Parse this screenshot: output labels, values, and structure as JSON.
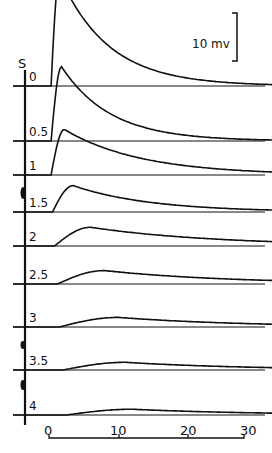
{
  "figure": {
    "stim_label": "S",
    "scale_bar_label": "10 mv",
    "x_ticks": [
      "0",
      "10",
      "20",
      "30"
    ]
  },
  "chart_data": {
    "type": "line",
    "title": "",
    "xlabel": "",
    "ylabel": "",
    "scale_bar": {
      "label": "10 mv",
      "orientation": "vertical"
    },
    "x_ticks": [
      0,
      10,
      20,
      30
    ],
    "xlim": [
      -4,
      33
    ],
    "grid": false,
    "legend": "trace labels at left of each baseline",
    "series": [
      {
        "name": "0",
        "onset": 0.3,
        "peak_mv": 23.0,
        "peak_time": 1.5,
        "decay": "fast"
      },
      {
        "name": "0.5",
        "onset": 0.3,
        "peak_mv": 15.5,
        "peak_time": 1.8,
        "decay": "fast"
      },
      {
        "name": "1",
        "onset": 0.3,
        "peak_mv": 9.5,
        "peak_time": 2.2,
        "decay": "medium"
      },
      {
        "name": "1.5",
        "onset": 0.5,
        "peak_mv": 5.5,
        "peak_time": 3.5,
        "decay": "medium"
      },
      {
        "name": "2",
        "onset": 0.8,
        "peak_mv": 3.9,
        "peak_time": 6,
        "decay": "slow"
      },
      {
        "name": "2.5",
        "onset": 1.2,
        "peak_mv": 2.8,
        "peak_time": 8,
        "decay": "slow"
      },
      {
        "name": "3",
        "onset": 1.5,
        "peak_mv": 2.0,
        "peak_time": 10,
        "decay": "slow"
      },
      {
        "name": "3.5",
        "onset": 2.0,
        "peak_mv": 1.6,
        "peak_time": 11,
        "decay": "slow"
      },
      {
        "name": "4",
        "onset": 2.5,
        "peak_mv": 1.2,
        "peak_time": 12,
        "decay": "slow"
      }
    ]
  },
  "traces": [
    {
      "label": "0"
    },
    {
      "label": "0.5"
    },
    {
      "label": "1"
    },
    {
      "label": "1.5"
    },
    {
      "label": "2"
    },
    {
      "label": "2.5"
    },
    {
      "label": "3"
    },
    {
      "label": "3.5"
    },
    {
      "label": "4"
    }
  ]
}
